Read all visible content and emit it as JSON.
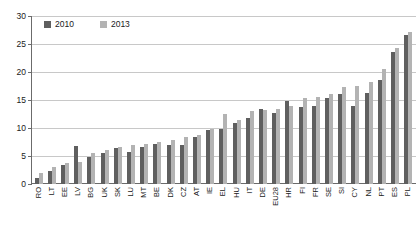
{
  "chart_data": {
    "type": "bar",
    "title": "",
    "xlabel": "",
    "ylabel": "",
    "ylim": [
      0,
      30
    ],
    "ytick_step": 5,
    "yticks": [
      0,
      5,
      10,
      15,
      20,
      25,
      30
    ],
    "grid": true,
    "legend_position": "top-left",
    "categories": [
      "RO",
      "LT",
      "EE",
      "LV",
      "BG",
      "UK",
      "SK",
      "LU",
      "MT",
      "BE",
      "DK",
      "CZ",
      "AT",
      "IE",
      "EL",
      "HU",
      "IT",
      "DE",
      "EU28",
      "HR",
      "FI",
      "FR",
      "SE",
      "SI",
      "CY",
      "NL",
      "PT",
      "ES",
      "PL"
    ],
    "series": [
      {
        "name": "2010",
        "color": "#5f5f5f",
        "values": [
          1.0,
          2.3,
          3.4,
          6.8,
          4.9,
          5.6,
          6.4,
          5.8,
          6.6,
          7.2,
          7.0,
          6.9,
          8.4,
          9.6,
          9.8,
          10.9,
          11.8,
          13.4,
          12.6,
          14.8,
          13.8,
          14.0,
          15.4,
          16.0,
          13.9,
          16.3,
          18.5,
          23.5,
          26.6
        ],
        "unit": ""
      },
      {
        "name": "2013",
        "color": "#b3b3b3",
        "values": [
          1.9,
          3.0,
          3.7,
          4.0,
          5.6,
          6.0,
          6.6,
          6.9,
          7.1,
          7.5,
          7.8,
          8.4,
          8.8,
          9.8,
          12.5,
          11.5,
          13.0,
          13.2,
          13.4,
          14.0,
          15.4,
          15.5,
          16.0,
          17.3,
          17.5,
          18.3,
          20.5,
          24.2,
          27.2
        ],
        "unit": ""
      }
    ]
  },
  "legend": {
    "items": [
      {
        "label": "2010",
        "key": "s2010"
      },
      {
        "label": "2013",
        "key": "s2013"
      }
    ]
  }
}
